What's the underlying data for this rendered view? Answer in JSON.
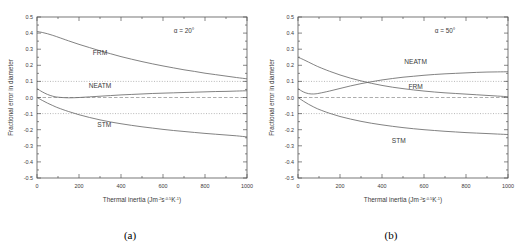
{
  "figure": {
    "panels": [
      {
        "caption": "(a)",
        "annotation": "α = 20°",
        "chart_data": {
          "type": "line",
          "title": "",
          "xlabel": "Thermal inertia (Jm⁻²s⁻⁰·⁵K⁻¹)",
          "xlabel_base": "Thermal inertia (Jm",
          "xlabel_sup1": "-2",
          "xlabel_mid1": "s",
          "xlabel_sup2": "-0.5",
          "xlabel_mid2": "K",
          "xlabel_sup3": "-1",
          "xlabel_end": ")",
          "ylabel": "Fractional error in diameter",
          "xlim": [
            0,
            1000
          ],
          "ylim": [
            -0.5,
            0.5
          ],
          "xticks": [
            0,
            200,
            400,
            600,
            800,
            1000
          ],
          "yticks": [
            0.5,
            0.4,
            0.3,
            0.2,
            0.1,
            0.0,
            -0.1,
            -0.2,
            -0.3,
            -0.4,
            -0.5
          ],
          "xtick_labels": [
            "0",
            "200",
            "400",
            "600",
            "800",
            "1000"
          ],
          "ytick_labels": [
            "0.5",
            "0.4",
            "0.3",
            "0.2",
            "0.1",
            "0.0",
            "-0.1",
            "-0.2",
            "-0.3",
            "-0.4",
            "-0.5"
          ],
          "xminor_step": 100,
          "yminor_step": 0.05,
          "grid": false,
          "reference_lines": [
            {
              "name": "plus-0.1-dotted",
              "y": 0.1,
              "style": "dotted"
            },
            {
              "name": "zero-dashed",
              "y": 0.0,
              "style": "dashed"
            },
            {
              "name": "minus-0.1-dotted",
              "y": -0.1,
              "style": "dotted"
            }
          ],
          "x": [
            0,
            25,
            50,
            75,
            100,
            150,
            200,
            250,
            300,
            350,
            400,
            450,
            500,
            550,
            600,
            650,
            700,
            750,
            800,
            850,
            900,
            950,
            1000
          ],
          "series": [
            {
              "name": "FRM",
              "label": "FRM",
              "label_x": 300,
              "label_y": 0.265,
              "values": [
                0.41,
                0.404,
                0.396,
                0.386,
                0.375,
                0.352,
                0.33,
                0.31,
                0.29,
                0.272,
                0.254,
                0.238,
                0.223,
                0.209,
                0.196,
                0.184,
                0.172,
                0.162,
                0.151,
                0.142,
                0.133,
                0.124,
                0.116
              ]
            },
            {
              "name": "NEATM",
              "label": "NEATM",
              "label_x": 300,
              "label_y": 0.057,
              "values": [
                0.055,
                0.035,
                0.019,
                0.008,
                0.002,
                -0.002,
                0.0,
                0.004,
                0.008,
                0.012,
                0.016,
                0.019,
                0.022,
                0.025,
                0.027,
                0.029,
                0.031,
                0.033,
                0.035,
                0.037,
                0.038,
                0.04,
                0.042
              ]
            },
            {
              "name": "STM",
              "label": "STM",
              "label_x": 320,
              "label_y": -0.185,
              "values": [
                0.0,
                -0.018,
                -0.035,
                -0.05,
                -0.064,
                -0.087,
                -0.107,
                -0.124,
                -0.139,
                -0.152,
                -0.163,
                -0.173,
                -0.182,
                -0.19,
                -0.198,
                -0.205,
                -0.211,
                -0.217,
                -0.223,
                -0.228,
                -0.233,
                -0.238,
                -0.245
              ]
            }
          ]
        }
      },
      {
        "caption": "(b)",
        "annotation": "α = 50°",
        "chart_data": {
          "type": "line",
          "title": "",
          "xlabel": "Thermal inertia (Jm⁻²s⁻⁰·⁵K⁻¹)",
          "xlabel_base": "Thermal inertia (Jm",
          "xlabel_sup1": "-2",
          "xlabel_mid1": "s",
          "xlabel_sup2": "-0.5",
          "xlabel_mid2": "K",
          "xlabel_sup3": "-1",
          "xlabel_end": ")",
          "ylabel": "Fractional error in diameter",
          "xlim": [
            0,
            1000
          ],
          "ylim": [
            -0.5,
            0.5
          ],
          "xticks": [
            0,
            200,
            400,
            600,
            800,
            1000
          ],
          "yticks": [
            0.5,
            0.4,
            0.3,
            0.2,
            0.1,
            0.0,
            -0.1,
            -0.2,
            -0.3,
            -0.4,
            -0.5
          ],
          "xtick_labels": [
            "0",
            "200",
            "400",
            "600",
            "800",
            "1000"
          ],
          "ytick_labels": [
            "0.5",
            "0.4",
            "0.3",
            "0.2",
            "0.1",
            "0.0",
            "-0.1",
            "-0.2",
            "-0.3",
            "-0.4",
            "-0.5"
          ],
          "xminor_step": 100,
          "yminor_step": 0.05,
          "grid": false,
          "reference_lines": [
            {
              "name": "plus-0.1-dotted",
              "y": 0.1,
              "style": "dotted"
            },
            {
              "name": "zero-dashed",
              "y": 0.0,
              "style": "dashed"
            },
            {
              "name": "minus-0.1-dotted",
              "y": -0.1,
              "style": "dotted"
            }
          ],
          "x": [
            0,
            25,
            50,
            75,
            100,
            150,
            200,
            250,
            300,
            350,
            400,
            450,
            500,
            550,
            600,
            650,
            700,
            750,
            800,
            850,
            900,
            950,
            1000
          ],
          "series": [
            {
              "name": "FRM",
              "label": "FRM",
              "label_x": 560,
              "label_y": 0.055,
              "values": [
                0.25,
                0.236,
                0.22,
                0.204,
                0.189,
                0.163,
                0.14,
                0.12,
                0.103,
                0.088,
                0.075,
                0.064,
                0.055,
                0.047,
                0.04,
                0.034,
                0.029,
                0.025,
                0.021,
                0.017,
                0.013,
                0.009,
                0.005
              ]
            },
            {
              "name": "NEATM",
              "label": "NEATM",
              "label_x": 560,
              "label_y": 0.205,
              "values": [
                0.055,
                0.035,
                0.024,
                0.022,
                0.026,
                0.04,
                0.056,
                0.072,
                0.086,
                0.098,
                0.109,
                0.118,
                0.126,
                0.132,
                0.138,
                0.143,
                0.147,
                0.15,
                0.153,
                0.156,
                0.158,
                0.159,
                0.16
              ]
            },
            {
              "name": "STM",
              "label": "STM",
              "label_x": 480,
              "label_y": -0.285,
              "values": [
                0.0,
                -0.022,
                -0.042,
                -0.059,
                -0.074,
                -0.098,
                -0.118,
                -0.134,
                -0.148,
                -0.16,
                -0.17,
                -0.179,
                -0.187,
                -0.194,
                -0.2,
                -0.205,
                -0.21,
                -0.214,
                -0.218,
                -0.221,
                -0.224,
                -0.227,
                -0.23
              ]
            }
          ]
        }
      }
    ]
  }
}
